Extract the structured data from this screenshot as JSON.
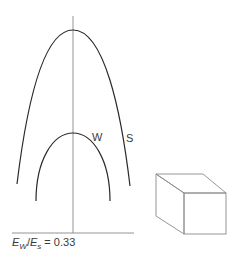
{
  "diagram": {
    "curves": [
      {
        "name": "outer-curve",
        "label": "S"
      },
      {
        "name": "inner-curve",
        "label": "W"
      }
    ],
    "labels": {
      "w": "W",
      "s": "S"
    },
    "ratio": {
      "e1": "E",
      "sub1": "W",
      "slash": "/",
      "e2": "E",
      "sub2": "s",
      "equals": " = ",
      "value": "0.33"
    },
    "colors": {
      "curve": "#2a2a2a",
      "axis": "#6a6a6a",
      "box": "#8a8a8a"
    }
  }
}
